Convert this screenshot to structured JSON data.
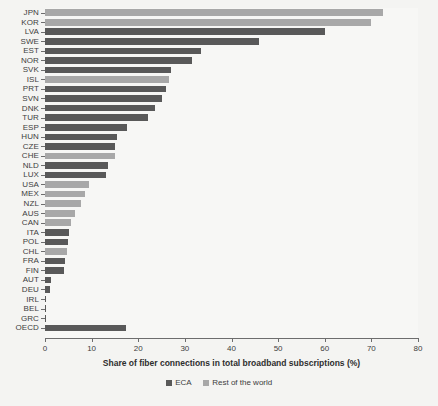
{
  "chart_data": {
    "type": "bar",
    "orientation": "horizontal",
    "title": "",
    "xlabel": "Share of fiber connections in total broadband subscriptions (%)",
    "ylabel": "",
    "xlim": [
      0,
      80
    ],
    "xticks": [
      0,
      10,
      20,
      30,
      40,
      50,
      60,
      70,
      80
    ],
    "grid": false,
    "legend_position": "bottom",
    "legend": [
      {
        "name": "ECA",
        "color": "#595959"
      },
      {
        "name": "Rest of the world",
        "color": "#a8a8a8"
      }
    ],
    "categories": [
      "JPN",
      "KOR",
      "LVA",
      "SWE",
      "EST",
      "NOR",
      "SVK",
      "ISL",
      "PRT",
      "SVN",
      "DNK",
      "TUR",
      "ESP",
      "HUN",
      "CZE",
      "CHE",
      "NLD",
      "LUX",
      "USA",
      "MEX",
      "NZL",
      "AUS",
      "CAN",
      "ITA",
      "POL",
      "CHL",
      "FRA",
      "FIN",
      "AUT",
      "DEU",
      "IRL",
      "BEL",
      "GRC",
      "OECD"
    ],
    "values": [
      72.5,
      70.0,
      60.0,
      46.0,
      33.5,
      31.5,
      27.0,
      26.5,
      26.0,
      25.0,
      23.5,
      22.0,
      17.5,
      15.5,
      15.0,
      15.0,
      13.5,
      13.0,
      9.5,
      8.5,
      7.8,
      6.5,
      5.6,
      5.2,
      5.0,
      4.8,
      4.3,
      4.0,
      1.3,
      1.1,
      0.3,
      0.2,
      0.15,
      17.3
    ],
    "groups": [
      "Rest of the world",
      "Rest of the world",
      "ECA",
      "ECA",
      "ECA",
      "ECA",
      "ECA",
      "Rest of the world",
      "ECA",
      "ECA",
      "ECA",
      "ECA",
      "ECA",
      "ECA",
      "ECA",
      "Rest of the world",
      "ECA",
      "ECA",
      "Rest of the world",
      "Rest of the world",
      "Rest of the world",
      "Rest of the world",
      "Rest of the world",
      "ECA",
      "ECA",
      "Rest of the world",
      "ECA",
      "ECA",
      "ECA",
      "ECA",
      "ECA",
      "ECA",
      "ECA",
      "ECA"
    ]
  }
}
